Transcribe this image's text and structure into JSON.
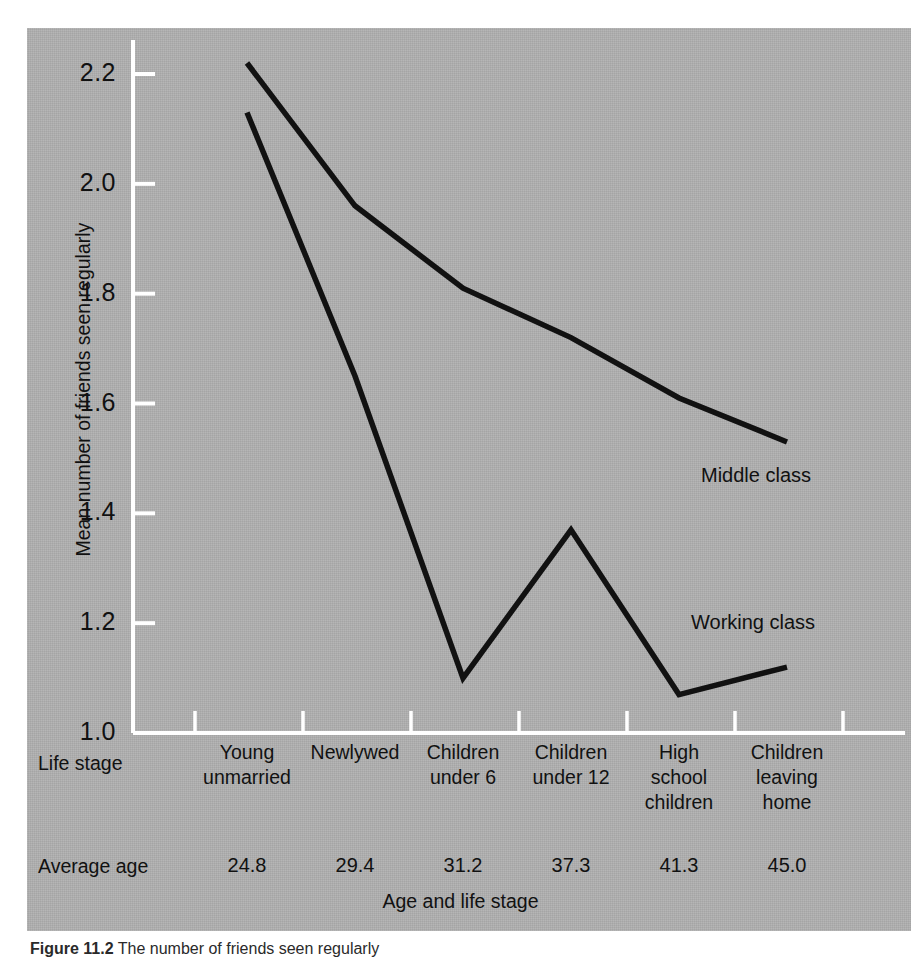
{
  "figure": {
    "panel_color": "#b0b0b0",
    "line_color": "#111111",
    "axis_color": "#ffffff"
  },
  "chart_data": {
    "type": "line",
    "title": "",
    "xlabel": "Age and life stage",
    "ylabel": "Mean number of friends seen regularly",
    "ylim": [
      1.0,
      2.3
    ],
    "yticks": [
      "1.0",
      "1.2",
      "1.4",
      "1.6",
      "1.8",
      "2.0",
      "2.2"
    ],
    "ytick_values": [
      1.0,
      1.2,
      1.4,
      1.6,
      1.8,
      2.0,
      2.2
    ],
    "grid": false,
    "legend_position": "inline-right",
    "categories": [
      "Young unmarried",
      "Newlywed",
      "Children under 6",
      "Children under 12",
      "High school children",
      "Children leaving home"
    ],
    "category_lines": [
      [
        "Young",
        "unmarried"
      ],
      [
        "Newlywed"
      ],
      [
        "Children",
        "under 6"
      ],
      [
        "Children",
        "under 12"
      ],
      [
        "High",
        "school",
        "children"
      ],
      [
        "Children",
        "leaving",
        "home"
      ]
    ],
    "series": [
      {
        "name": "Middle class",
        "values": [
          2.22,
          1.96,
          1.81,
          1.72,
          1.61,
          1.53
        ]
      },
      {
        "name": "Working class",
        "values": [
          2.13,
          1.65,
          1.1,
          1.37,
          1.07,
          1.12
        ]
      }
    ]
  },
  "axis_rows": {
    "life_stage_label": "Life stage",
    "average_age_label": "Average age",
    "average_ages": [
      "24.8",
      "29.4",
      "31.2",
      "37.3",
      "41.3",
      "45.0"
    ]
  },
  "caption": {
    "figure_number": "Figure 11.2",
    "text": "The number of friends seen regularly"
  }
}
